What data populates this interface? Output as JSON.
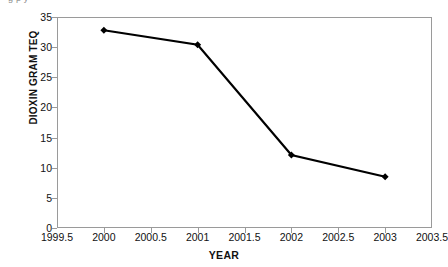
{
  "figure": {
    "clipped_caption": "g    p          y",
    "background_color": "#ffffff",
    "frame_color": "#9a9a9a"
  },
  "chart_data": {
    "type": "line",
    "title": "",
    "xlabel": "YEAR",
    "ylabel": "DIOXIN GRAM TEQ",
    "x": [
      2000,
      2001,
      2002,
      2003
    ],
    "values": [
      32.8,
      30.4,
      12.1,
      8.5
    ],
    "series": [
      {
        "name": "DIOXIN GRAM TEQ",
        "values": [
          32.8,
          30.4,
          12.1,
          8.5
        ],
        "color": "#000000",
        "marker": "diamond",
        "line_width": 2.2
      }
    ],
    "xlim": [
      1999.5,
      2003.5
    ],
    "ylim": [
      0,
      35
    ],
    "xticks": [
      1999.5,
      2000,
      2000.5,
      2001,
      2001.5,
      2002,
      2002.5,
      2003,
      2003.5
    ],
    "xticklabels": [
      "1999.5",
      "2000",
      "2000.5",
      "2001",
      "2001.5",
      "2002",
      "2002.5",
      "2003",
      "2003.5"
    ],
    "yticks": [
      0,
      5,
      10,
      15,
      20,
      25,
      30,
      35
    ],
    "yticklabels": [
      "0",
      "5",
      "10",
      "15",
      "20",
      "25",
      "30",
      "35"
    ],
    "grid": false,
    "legend": false
  }
}
